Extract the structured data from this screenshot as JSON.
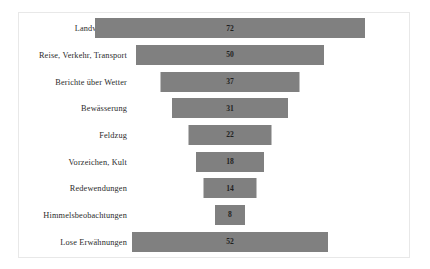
{
  "chart_data": {
    "type": "bar",
    "subtype": "funnel",
    "title": "",
    "subtitle": "",
    "xlabel": "",
    "ylabel": "",
    "grid": false,
    "legend": null,
    "orientation": "horizontal-centered",
    "value_label_position": "inside-center",
    "categories": [
      "Landwirtschaft",
      "Reise, Verkehr, Transport",
      "Berichte über Wetter",
      "Bewässerung",
      "Feldzug",
      "Vorzeichen, Kult",
      "Redewendungen",
      "Himmelsbeobachtungen",
      "Lose Erwähnungen"
    ],
    "values": [
      72,
      50,
      37,
      31,
      22,
      18,
      14,
      8,
      52
    ],
    "xlim": [
      0,
      72
    ],
    "colors": {
      "bar": "#808080",
      "value_text": "#1f1f1f",
      "category_text": "#2b2b2b",
      "frame_border": "#e8e8e8",
      "background": "#ffffff"
    },
    "rows": [
      {
        "label": "Landwirtschaft",
        "value": 72,
        "bar_px": 270
      },
      {
        "label": "Reise, Verkehr, Transport",
        "value": 50,
        "bar_px": 188
      },
      {
        "label": "Berichte über Wetter",
        "value": 37,
        "bar_px": 139
      },
      {
        "label": "Bewässerung",
        "value": 31,
        "bar_px": 116
      },
      {
        "label": "Feldzug",
        "value": 22,
        "bar_px": 83
      },
      {
        "label": "Vorzeichen, Kult",
        "value": 18,
        "bar_px": 68
      },
      {
        "label": "Redewendungen",
        "value": 14,
        "bar_px": 53
      },
      {
        "label": "Himmelsbeobachtungen",
        "value": 8,
        "bar_px": 30
      },
      {
        "label": "Lose Erwähnungen",
        "value": 52,
        "bar_px": 196
      }
    ]
  }
}
